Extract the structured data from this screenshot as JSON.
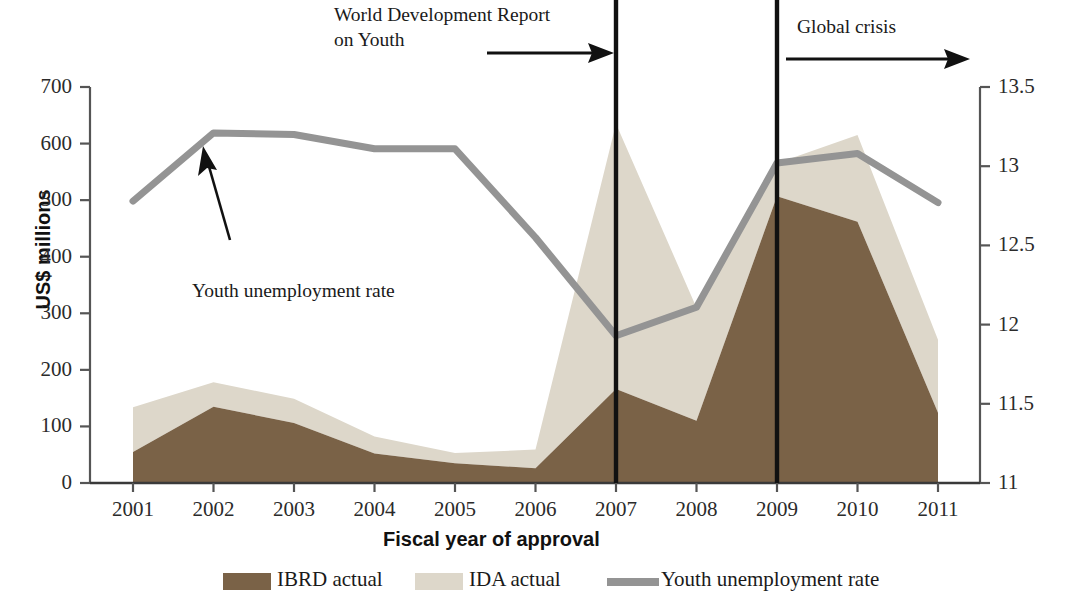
{
  "chart_data": {
    "type": "area",
    "title": "",
    "subtitle": "",
    "xlabel": "Fiscal year of approval",
    "ylabel": "US$ millions",
    "y2label": "Youth unemployment rate (%)",
    "categories": [
      "2001",
      "2002",
      "2003",
      "2004",
      "2005",
      "2006",
      "2007",
      "2008",
      "2009",
      "2010",
      "2011"
    ],
    "x_tick_labels": [
      "2001",
      "2002",
      "2003",
      "2004",
      "2005",
      "2006",
      "2007",
      "2008",
      "2009",
      "2010",
      "2011"
    ],
    "y_tick_labels": [
      "0",
      "100",
      "200",
      "300",
      "400",
      "500",
      "600",
      "700"
    ],
    "y_ticks": [
      0,
      100,
      200,
      300,
      400,
      500,
      600,
      700
    ],
    "ylim": [
      0,
      700
    ],
    "y2_tick_labels": [
      "11",
      "11.5",
      "12",
      "12.5",
      "13",
      "13.5"
    ],
    "y2_ticks": [
      11,
      11.5,
      12,
      12.5,
      13,
      13.5
    ],
    "y2lim": [
      11,
      13.5
    ],
    "grid": false,
    "legend_position": "bottom",
    "stacked": true,
    "series": [
      {
        "name": "IBRD actual",
        "type": "area",
        "axis": "left",
        "color": "#7a6247",
        "values": [
          55,
          135,
          106,
          52,
          35,
          26,
          166,
          110,
          507,
          462,
          124
        ]
      },
      {
        "name": "IDA actual",
        "type": "area",
        "axis": "left",
        "color": "#ddd7ca",
        "note": "plotted stacked on top of IBRD actual",
        "values": [
          79,
          43,
          43,
          30,
          18,
          33,
          469,
          200,
          58,
          153,
          129
        ]
      },
      {
        "name": "Youth unemployment rate",
        "type": "line",
        "axis": "right",
        "color": "#949494",
        "values": [
          12.78,
          13.21,
          13.2,
          13.11,
          13.11,
          12.55,
          11.93,
          12.11,
          13.02,
          13.08,
          12.77
        ]
      }
    ],
    "stacked_totals": [
      134,
      178,
      149,
      82,
      53,
      59,
      635,
      310,
      565,
      615,
      253
    ],
    "annotations": [
      {
        "id": "wdr-youth",
        "text_line1": "World Development Report",
        "text_line2": "on Youth",
        "marker_year": "2007",
        "arrow_direction": "right"
      },
      {
        "id": "global-crisis",
        "text_line1": "Global crisis",
        "text_line2": "",
        "marker_year": "2009",
        "arrow_direction": "right"
      },
      {
        "id": "youth-rate-callout",
        "text_line1": "Youth unemployment rate",
        "text_line2": "",
        "arrow_direction": "up-left"
      }
    ],
    "legend": [
      {
        "label": "IBRD actual",
        "color": "#7a6247",
        "marker": "swatch"
      },
      {
        "label": "IDA actual",
        "color": "#ddd7ca",
        "marker": "swatch"
      },
      {
        "label": "Youth unemployment rate",
        "color": "#949494",
        "marker": "line"
      }
    ]
  },
  "axes": {
    "left_title": "US$ millions",
    "right_title": "Youth unemployment rate (%)",
    "x_title": "Fiscal year of approval"
  },
  "colors": {
    "ibrd": "#7a6247",
    "ida": "#ddd7ca",
    "rate_line": "#949494",
    "marker_line": "#111111",
    "axis": "#5a5a5a",
    "text": "#1a1a1a"
  }
}
